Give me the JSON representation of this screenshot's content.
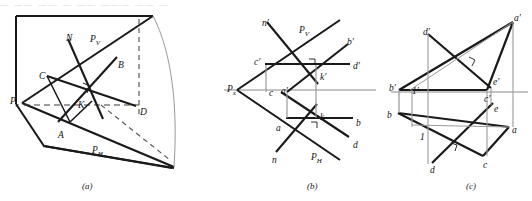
{
  "figure": {
    "top_strip_text": "— —— —— — —— ——— —— —",
    "captions": [
      {
        "key": "a",
        "text": "(a)",
        "x": 82,
        "y": 181
      },
      {
        "key": "b",
        "text": "(b)",
        "x": 307,
        "y": 181
      },
      {
        "key": "c",
        "text": "(c)",
        "x": 466,
        "y": 181
      }
    ],
    "panels": [
      {
        "id": "a",
        "name": "pictorial-view",
        "description": "Pictorial view of two projection planes with line AB, line CD, normal N and intersection point K",
        "labels": [
          {
            "name": "label-N",
            "text": "N",
            "x": 66,
            "y": 33
          },
          {
            "name": "label-Pv",
            "text": "P",
            "sub": "V",
            "x": 90,
            "y": 34
          },
          {
            "name": "label-C",
            "text": "C",
            "x": 39,
            "y": 71
          },
          {
            "name": "label-B",
            "text": "B",
            "x": 118,
            "y": 60
          },
          {
            "name": "label-K",
            "text": "K",
            "x": 78,
            "y": 100
          },
          {
            "name": "label-D",
            "text": "D",
            "x": 140,
            "y": 107
          },
          {
            "name": "label-Px",
            "text": "P",
            "sub": "x",
            "x": 10,
            "y": 96
          },
          {
            "name": "label-A",
            "text": "A",
            "x": 58,
            "y": 130
          },
          {
            "name": "label-Ph",
            "text": "P",
            "sub": "H",
            "x": 92,
            "y": 145
          }
        ]
      },
      {
        "id": "b",
        "name": "two-view-projection",
        "description": "Orthographic two-view drawing: frontal and horizontal traces of plane P, line a-b / a'-b', line c-d / c'-d', normal n-n', intersection k-k'",
        "labels": [
          {
            "name": "label-n-prime",
            "text": "n′",
            "x": 262,
            "y": 18
          },
          {
            "name": "label-Pv",
            "text": "P",
            "sub": "V",
            "x": 299,
            "y": 25
          },
          {
            "name": "label-b-prime",
            "text": "b′",
            "x": 347,
            "y": 37
          },
          {
            "name": "label-c-prime",
            "text": "c′",
            "x": 254,
            "y": 57
          },
          {
            "name": "label-d-prime",
            "text": "d′",
            "x": 353,
            "y": 61
          },
          {
            "name": "label-k-prime",
            "text": "k′",
            "x": 320,
            "y": 72
          },
          {
            "name": "label-Px",
            "text": "P",
            "sub": "x",
            "x": 227,
            "y": 84
          },
          {
            "name": "label-c",
            "text": "c",
            "x": 269,
            "y": 88
          },
          {
            "name": "label-a-prime",
            "text": "a′",
            "x": 281,
            "y": 86
          },
          {
            "name": "label-k",
            "text": "k",
            "x": 320,
            "y": 112
          },
          {
            "name": "label-b",
            "text": "b",
            "x": 356,
            "y": 118
          },
          {
            "name": "label-a",
            "text": "a",
            "x": 276,
            "y": 123
          },
          {
            "name": "label-d",
            "text": "d",
            "x": 353,
            "y": 140
          },
          {
            "name": "label-n",
            "text": "n",
            "x": 272,
            "y": 155
          },
          {
            "name": "label-Ph",
            "text": "P",
            "sub": "H",
            "x": 311,
            "y": 152
          }
        ]
      },
      {
        "id": "c",
        "name": "triangle-line-intersection",
        "description": "Orthographic two-view drawing: triangle a-b-c / a'-b'-c' pierced by line d-e / d'-e', auxiliary point 1 / 1'",
        "labels": [
          {
            "name": "label-a-prime",
            "text": "a′",
            "x": 514,
            "y": 13
          },
          {
            "name": "label-d-prime",
            "text": "d′",
            "x": 423,
            "y": 27
          },
          {
            "name": "label-e-prime",
            "text": "e′",
            "x": 493,
            "y": 77
          },
          {
            "name": "label-b-prime",
            "text": "b′",
            "x": 389,
            "y": 83
          },
          {
            "name": "label-1-prime",
            "text": "1′",
            "x": 412,
            "y": 86
          },
          {
            "name": "label-c-prime",
            "text": "c′",
            "x": 484,
            "y": 94
          },
          {
            "name": "label-e",
            "text": "e",
            "x": 494,
            "y": 104
          },
          {
            "name": "label-b",
            "text": "b",
            "x": 387,
            "y": 110
          },
          {
            "name": "label-a",
            "text": "a",
            "x": 512,
            "y": 125
          },
          {
            "name": "label-1",
            "text": "1",
            "x": 420,
            "y": 132
          },
          {
            "name": "label-c",
            "text": "c",
            "x": 483,
            "y": 160
          },
          {
            "name": "label-d",
            "text": "d",
            "x": 430,
            "y": 165
          }
        ]
      }
    ],
    "colors": {
      "ink": "#1a1a1a",
      "thin": "#888888",
      "dashed": "#4a4a4a",
      "background": "#ffffff"
    }
  }
}
